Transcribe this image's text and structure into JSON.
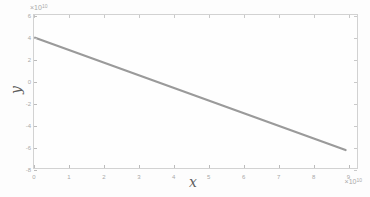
{
  "figure": {
    "background": "#fdfdfd",
    "plot_background": "#fefefe",
    "box_border_color": "#d2d2d2",
    "tick_color": "#bcbcbc",
    "tick_label_color": "#a9a9a9",
    "axis_letter_color": "#5f5f5f"
  },
  "chart_data": {
    "type": "line",
    "title": "",
    "xlabel": "x",
    "ylabel": "y",
    "x_scale_exponent": {
      "base": "×10",
      "power": "10"
    },
    "y_scale_exponent": {
      "base": "×10",
      "power": "10"
    },
    "units_note": "all tick values are multiples of 10^10",
    "x_ticks": [
      "0",
      "1",
      "2",
      "3",
      "4",
      "5",
      "6",
      "7",
      "8",
      "9"
    ],
    "x_tick_values": [
      0,
      1,
      2,
      3,
      4,
      5,
      6,
      7,
      8,
      9
    ],
    "y_ticks": [
      "6",
      "4",
      "2",
      "0",
      "-2",
      "-4",
      "-6",
      "-8"
    ],
    "y_tick_values": [
      6,
      4,
      2,
      0,
      -2,
      -4,
      -6,
      -8
    ],
    "xlim": [
      0,
      9.3
    ],
    "ylim": [
      -8.0,
      6.09
    ],
    "grid": false,
    "box_on": true,
    "legend": null,
    "series": [
      {
        "name": "line1",
        "type": "line",
        "color": "#9a9a9a",
        "stroke_width": 2.2,
        "points": [
          {
            "x": 0.0,
            "y": 4.0
          },
          {
            "x": 9.0,
            "y": -6.35
          }
        ]
      }
    ]
  }
}
